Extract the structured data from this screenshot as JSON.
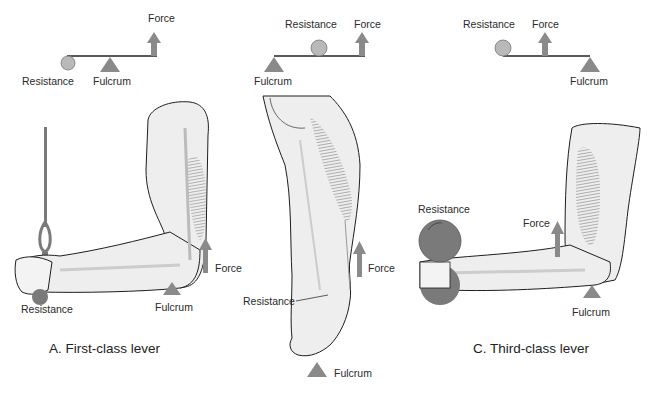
{
  "colors": {
    "shape_gray": "#8a8a8a",
    "ball_gray": "#b9b9b9",
    "weight_gray": "#7a7a7a",
    "skin": "#eeeeee",
    "outline": "#1e1e1e",
    "muscle": "#8f8f8f"
  },
  "panels": [
    {
      "id": "A",
      "caption": "A. First-class lever",
      "schematic": {
        "resistance": "Resistance",
        "fulcrum": "Fulcrum",
        "force": "Force"
      },
      "figure": {
        "subject": "arm pressing down on cable handle",
        "resistance": "Resistance",
        "fulcrum": "Fulcrum",
        "force": "Force"
      }
    },
    {
      "id": "B",
      "caption": "",
      "schematic": {
        "resistance": "Resistance",
        "fulcrum": "Fulcrum",
        "force": "Force"
      },
      "figure": {
        "subject": "lower leg standing on toes",
        "resistance": "Resistance",
        "fulcrum": "Fulcrum",
        "force": "Force"
      }
    },
    {
      "id": "C",
      "caption": "C. Third-class lever",
      "schematic": {
        "resistance": "Resistance",
        "fulcrum": "Fulcrum",
        "force": "Force"
      },
      "figure": {
        "subject": "arm curling a dumbbell",
        "resistance": "Resistance",
        "fulcrum": "Fulcrum",
        "force": "Force"
      }
    }
  ]
}
